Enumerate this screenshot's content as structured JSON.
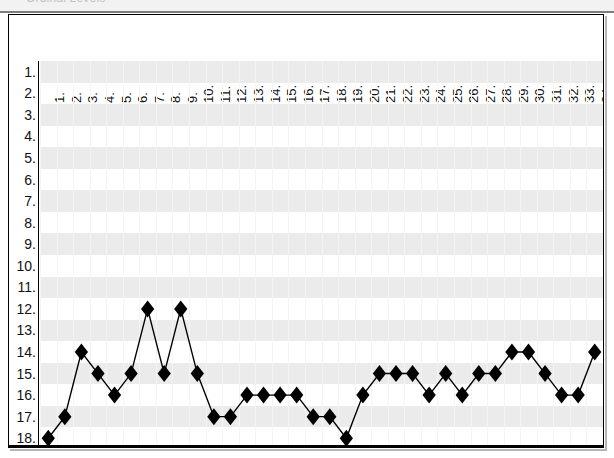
{
  "window": {
    "title": "Ordinal Levels"
  },
  "chart_data": {
    "type": "line",
    "title": "Ordinal Levels",
    "xlabel": "",
    "ylabel": "",
    "grid": true,
    "legend": "none",
    "y_axis_inverted": true,
    "xlim": [
      1,
      34
    ],
    "ylim": [
      1,
      18
    ],
    "marker": "filled-diamond",
    "line_color": "#000000",
    "marker_color": "#000000",
    "band_color": "#ebebeb",
    "x_tick_labels": [
      "1.",
      "2.",
      "3.",
      "4.",
      "5.",
      "6.",
      "7.",
      "8.",
      "9.",
      "10.",
      "11.",
      "12.",
      "13.",
      "14.",
      "15.",
      "16.",
      "17.",
      "18.",
      "19.",
      "20.",
      "21.",
      "22.",
      "23.",
      "24.",
      "25.",
      "26.",
      "27.",
      "28.",
      "29.",
      "30.",
      "31.",
      "32.",
      "33.",
      "34."
    ],
    "y_tick_labels": [
      "1.",
      "2.",
      "3.",
      "4.",
      "5.",
      "6.",
      "7.",
      "8.",
      "9.",
      "10.",
      "11.",
      "12.",
      "13.",
      "14.",
      "15.",
      "16.",
      "17.",
      "18."
    ],
    "x": [
      1,
      2,
      3,
      4,
      5,
      6,
      7,
      8,
      9,
      10,
      11,
      12,
      13,
      14,
      15,
      16,
      17,
      18,
      19,
      20,
      21,
      22,
      23,
      24,
      25,
      26,
      27,
      28,
      29,
      30,
      31,
      32,
      33,
      34
    ],
    "values": [
      18,
      17,
      14,
      15,
      16,
      15,
      12,
      15,
      12,
      15,
      17,
      17,
      16,
      16,
      16,
      16,
      17,
      17,
      18,
      16,
      15,
      15,
      15,
      16,
      15,
      16,
      15,
      15,
      14,
      14,
      15,
      16,
      16,
      14
    ]
  }
}
